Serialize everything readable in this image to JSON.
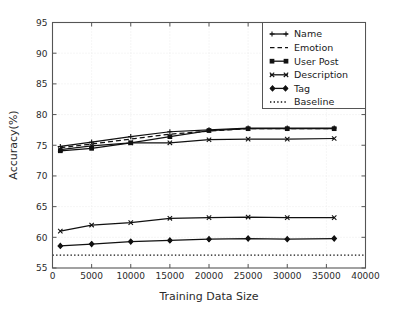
{
  "chart_data": {
    "type": "line",
    "title": "",
    "xlabel": "Training Data Size",
    "ylabel": "Accuracy(%)",
    "xlim": [
      0,
      40000
    ],
    "ylim": [
      55,
      95
    ],
    "xticks": [
      0,
      5000,
      10000,
      15000,
      20000,
      25000,
      30000,
      35000,
      40000
    ],
    "xtick_labels": [
      "0",
      "5000",
      "10000",
      "15000",
      "20000",
      "25000",
      "30000",
      "35000",
      "40000"
    ],
    "yticks": [
      55,
      60,
      65,
      70,
      75,
      80,
      85,
      90,
      95
    ],
    "ytick_labels": [
      "55",
      "60",
      "65",
      "70",
      "75",
      "80",
      "85",
      "90",
      "95"
    ],
    "grid": true,
    "legend_position": "upper right",
    "x": [
      1000,
      5000,
      10000,
      15000,
      20000,
      25000,
      30000,
      36000
    ],
    "series": [
      {
        "name": "Name",
        "linestyle": "solid",
        "marker": "plus",
        "values": [
          74.8,
          75.5,
          76.4,
          77.2,
          77.5,
          77.8,
          77.8,
          77.8
        ]
      },
      {
        "name": "Emotion",
        "linestyle": "dashed",
        "marker": "none",
        "values": [
          74.6,
          75.2,
          76.0,
          76.8,
          77.3,
          77.7,
          77.7,
          77.7
        ]
      },
      {
        "name": "User Post",
        "linestyle": "solid",
        "marker": "square",
        "values": [
          74.1,
          74.5,
          75.4,
          76.4,
          77.4,
          77.7,
          77.7,
          77.7
        ]
      },
      {
        "name": "Description",
        "linestyle": "solid",
        "marker": "x",
        "values": [
          74.3,
          74.9,
          75.4,
          75.4,
          75.9,
          76.0,
          76.0,
          76.1
        ]
      },
      {
        "name": "Tag",
        "linestyle": "solid",
        "marker": "diamond",
        "values": [
          58.6,
          58.9,
          59.3,
          59.5,
          59.7,
          59.8,
          59.7,
          59.8
        ]
      },
      {
        "name": "Baseline",
        "linestyle": "dotted",
        "marker": "none",
        "values": [
          57.1,
          57.1,
          57.1,
          57.1,
          57.1,
          57.1,
          57.1,
          57.1
        ]
      }
    ],
    "extra_series": [
      {
        "name": "Description-lower",
        "linestyle": "solid",
        "marker": "x",
        "values": [
          61.0,
          62.0,
          62.4,
          63.1,
          63.2,
          63.3,
          63.2,
          63.2
        ]
      }
    ],
    "legend_entries": [
      {
        "label": "Name",
        "style": "solid-marker"
      },
      {
        "label": "Emotion",
        "style": "dashed"
      },
      {
        "label": "User Post",
        "style": "solid-square"
      },
      {
        "label": "Description",
        "style": "solid-x"
      },
      {
        "label": "Tag",
        "style": "solid-diamond"
      },
      {
        "label": "Baseline",
        "style": "dotted"
      }
    ],
    "colors": {
      "line": "#111111",
      "grid": "#e8e8e8",
      "frame": "#555555",
      "background": "#ffffff"
    }
  }
}
